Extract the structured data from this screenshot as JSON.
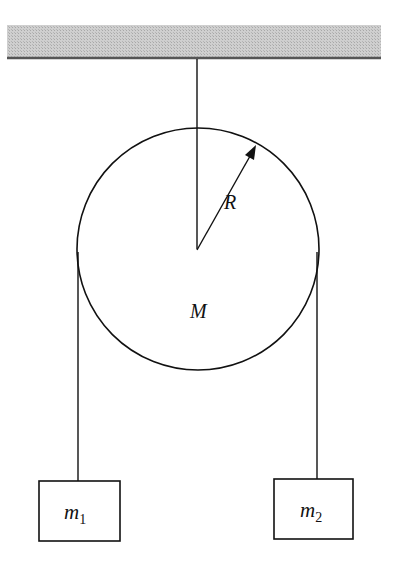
{
  "diagram": {
    "type": "pulley-system",
    "ceiling": {
      "fill": "#c8c8c8",
      "edge": "#555555"
    },
    "pulley": {
      "mass_label": "M",
      "radius_label": "R"
    },
    "masses": [
      {
        "label": "m",
        "subscript": "1"
      },
      {
        "label": "m",
        "subscript": "2"
      }
    ],
    "colors": {
      "line": "#111111",
      "background": "#ffffff"
    }
  }
}
